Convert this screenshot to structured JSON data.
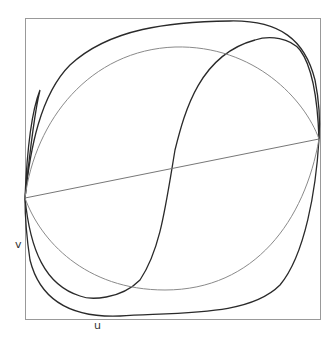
{
  "chart_data": {
    "type": "line",
    "title": "",
    "xlabel": "u",
    "ylabel": "v",
    "grid": false,
    "legend": null,
    "frame": {
      "x0": 25,
      "y0": 18,
      "x1": 320,
      "y1": 319,
      "color": "#999999"
    },
    "series": [
      {
        "name": "outer-loop",
        "color": "#2a2a2a",
        "width": 1.3,
        "path": "M25,198 C30,150 40,95 70,65 C110,28 170,22 230,21 C280,20 305,40 315,80 C320,105 320,125 319,139 C316,190 305,255 280,285 C250,315 190,312 120,316 C70,318 40,300 30,260 C27,240 25,220 25,198"
      },
      {
        "name": "s-curve-loop",
        "color": "#2a2a2a",
        "width": 1.3,
        "path": "M25,198 C27,150 32,110 40,90 M319,139 C318,110 315,70 300,50 C290,38 270,35 255,40 C200,55 185,110 175,150 C165,210 160,250 140,280 C120,300 90,300 80,296 C45,285 30,250 25,198 C30,150 35,110 40,90"
      },
      {
        "name": "gray-ellipse",
        "color": "#8a8a8a",
        "width": 1.0,
        "path": "M25,198 C35,120 90,50 175,47 C255,45 305,100 319,139 C305,220 255,290 165,290 C85,290 40,240 25,198"
      },
      {
        "name": "diagonal-chord",
        "color": "#777777",
        "width": 1.0,
        "path": "M25,198 L319,139"
      }
    ]
  },
  "labels": {
    "x": "u",
    "y": "v"
  }
}
